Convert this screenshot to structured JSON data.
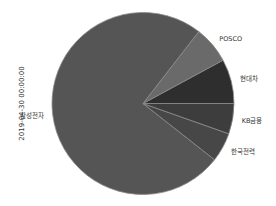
{
  "chart_data": {
    "type": "pie",
    "title": "",
    "ylabel": "2019-04-30 00:00:00",
    "xlabel": "",
    "start_angle_deg": 0,
    "counterclock": true,
    "legend": null,
    "categories": [
      "현대차",
      "POSCO",
      "삼성전자",
      "한국전력",
      "KB금융"
    ],
    "values": [
      7.9,
      6.6,
      74.9,
      5.2,
      5.4
    ],
    "colors": [
      "#2e2e2e",
      "#6a6a6a",
      "#555555",
      "#474747",
      "#3d3d3d"
    ],
    "edge_color": "#8a8a8a"
  },
  "layout": {
    "center": [
      143,
      103.5
    ],
    "radius": 91,
    "label_distance": 1.1
  }
}
